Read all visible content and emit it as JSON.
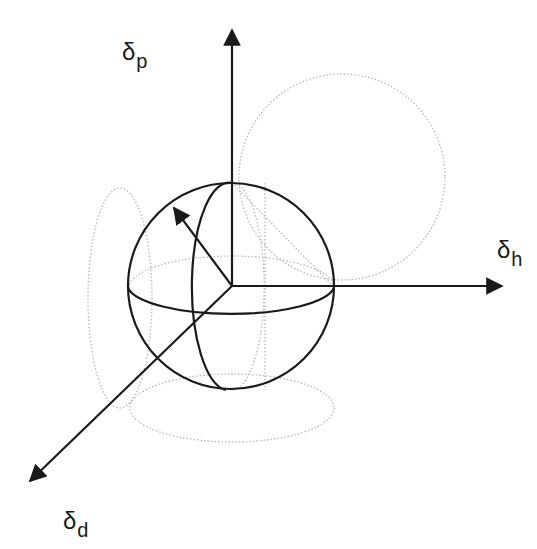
{
  "diagram": {
    "type": "3d-coordinate-sphere",
    "axes": [
      {
        "id": "dp",
        "symbol": "δ",
        "subscript": "p",
        "direction": "up"
      },
      {
        "id": "dh",
        "symbol": "δ",
        "subscript": "h",
        "direction": "right"
      },
      {
        "id": "dd",
        "symbol": "δ",
        "subscript": "d",
        "direction": "lower-left"
      }
    ],
    "sphere": {
      "style": "solid",
      "note": "sphere with equator and meridian, vector arrow from origin toward upper-left"
    },
    "projections": [
      {
        "plane": "δp-δh",
        "style": "dotted",
        "shape": "circle"
      },
      {
        "plane": "δp-δd",
        "style": "dotted",
        "shape": "ellipse"
      },
      {
        "plane": "δh-δd",
        "style": "dotted",
        "shape": "ellipse"
      }
    ],
    "colors": {
      "line": "#1a1a1a",
      "dotted": "#b8b8b8",
      "background": "#ffffff"
    }
  },
  "labels": {
    "dp": {
      "symbol": "δ",
      "sub": "p"
    },
    "dh": {
      "symbol": "δ",
      "sub": "h"
    },
    "dd": {
      "symbol": "δ",
      "sub": "d"
    }
  }
}
